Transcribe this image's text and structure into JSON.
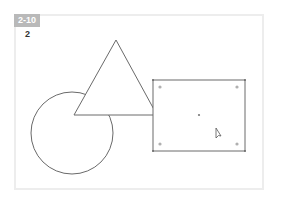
{
  "figure": {
    "badge": "2-10",
    "step": "2",
    "colors": {
      "stroke": "#6a6a6a",
      "handle": "#b0b0b0",
      "frame": "#ededed",
      "badge": "#b9b9b9"
    },
    "shapes": [
      "circle",
      "triangle",
      "rectangle-selected"
    ],
    "cursor": "arrow-pointer"
  }
}
